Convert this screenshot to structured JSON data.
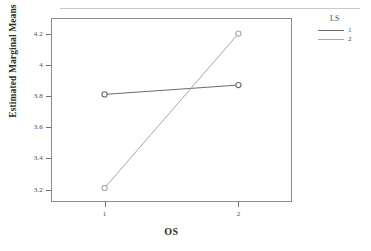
{
  "chart_data": {
    "type": "line",
    "title": "",
    "subtitle": "",
    "xlabel": "OS",
    "ylabel": "Estimated Marginal Means",
    "categories": [
      "1",
      "2"
    ],
    "x": [
      1,
      2
    ],
    "xlim": [
      0.6,
      2.4
    ],
    "ylim": [
      3.12,
      4.3
    ],
    "yticks": [
      "4.2",
      "4",
      "3.8",
      "3.6",
      "3.4",
      "3.2"
    ],
    "ytick_values": [
      4.2,
      4.0,
      3.8,
      3.6,
      3.4,
      3.2
    ],
    "xticks": [
      "1",
      "2"
    ],
    "grid": false,
    "legend_position": "right",
    "legend_title": "LS",
    "marker": "open-circle",
    "series": [
      {
        "name": "1",
        "values": [
          3.81,
          3.87
        ],
        "color": "#6b6b6b"
      },
      {
        "name": "2",
        "values": [
          3.21,
          4.2
        ],
        "color": "#a8a8a8"
      }
    ]
  },
  "legend": {
    "title": "LS",
    "entries": [
      {
        "label": "1",
        "color": "#6b6b6b"
      },
      {
        "label": "2",
        "color": "#a8a8a8"
      }
    ]
  },
  "axes": {
    "y_title": "Estimated Marginal Means",
    "x_title": "OS"
  }
}
